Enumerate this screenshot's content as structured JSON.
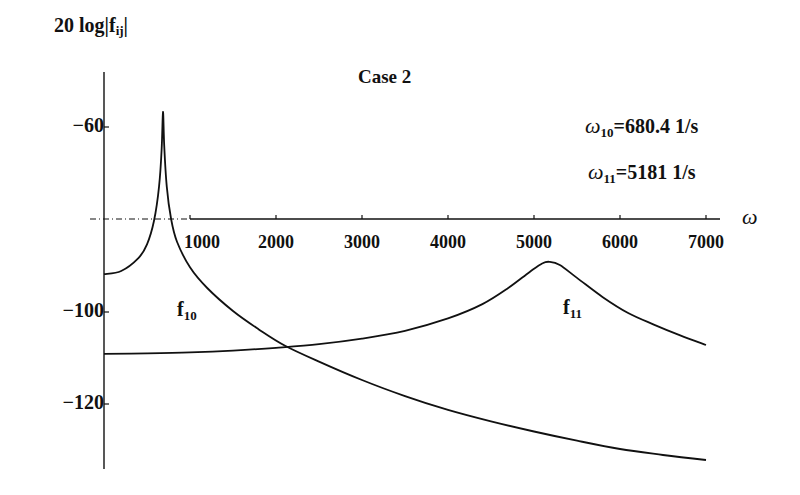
{
  "chart_data": {
    "type": "line",
    "title": "Case 2",
    "xlabel": "ω",
    "ylabel": "20 log|f_ij|",
    "xlim": [
      0,
      7200
    ],
    "ylim": [
      -134,
      -52
    ],
    "x_axis_crosses_y_at": -80,
    "grid": false,
    "legend": "inline curve labels",
    "x_ticks": [
      1000,
      2000,
      3000,
      4000,
      5000,
      6000,
      7000
    ],
    "y_ticks": [
      -60,
      -100,
      -120
    ],
    "annotations": [
      {
        "text": "ω10=680.4 1/s",
        "symbol": "ω",
        "sub": "10",
        "value": "=680.4  1/s"
      },
      {
        "text": "ω11=5181 1/s",
        "symbol": "ω",
        "sub": "11",
        "value": "=5181  1/s"
      }
    ],
    "series": [
      {
        "name": "f10",
        "label_base": "f",
        "label_sub": "10",
        "x": [
          0,
          200,
          400,
          500,
          580,
          640,
          670,
          686,
          700,
          730,
          780,
          850,
          1000,
          1200,
          1500,
          1800,
          2100,
          2500,
          3000,
          3500,
          4000,
          4500,
          5000,
          5500,
          6000,
          6500,
          7000
        ],
        "y": [
          -92,
          -91.3,
          -88.5,
          -85.5,
          -80.5,
          -73,
          -65,
          -56.7,
          -64,
          -73,
          -80,
          -85,
          -90.5,
          -95,
          -100,
          -104,
          -107.5,
          -111,
          -115,
          -118.5,
          -121.5,
          -124,
          -126.2,
          -128.2,
          -130,
          -131.3,
          -132.4
        ]
      },
      {
        "name": "f11",
        "label_base": "f",
        "label_sub": "11",
        "x": [
          0,
          500,
          1000,
          1500,
          2000,
          2500,
          3000,
          3500,
          4000,
          4400,
          4700,
          4950,
          5100,
          5180,
          5300,
          5500,
          5800,
          6100,
          6400,
          6700,
          7000
        ],
        "y": [
          -109.3,
          -109.2,
          -109,
          -108.6,
          -108,
          -107.2,
          -106,
          -104.3,
          -101.6,
          -98.5,
          -95,
          -91.5,
          -89.6,
          -89.3,
          -90,
          -92.8,
          -97,
          -100.5,
          -103,
          -105.3,
          -107.4
        ]
      }
    ]
  },
  "labels": {
    "ylabel_main": "20 log|f",
    "ylabel_sub": "ij",
    "ylabel_end": "|",
    "title": "Case 2",
    "x_name": "ω",
    "ann1_symbol": "ω",
    "ann1_sub": "10",
    "ann1_value": "=680.4  1/s",
    "ann2_symbol": "ω",
    "ann2_sub": "11",
    "ann2_value": "=5181  1/s",
    "f10_base": "f",
    "f10_sub": "10",
    "f11_base": "f",
    "f11_sub": "11",
    "ytick_m60": "−60",
    "ytick_m100": "−100",
    "ytick_m120": "−120",
    "xtick_1000": "1000",
    "xtick_2000": "2000",
    "xtick_3000": "3000",
    "xtick_4000": "4000",
    "xtick_5000": "5000",
    "xtick_6000": "6000",
    "xtick_7000": "7000"
  }
}
